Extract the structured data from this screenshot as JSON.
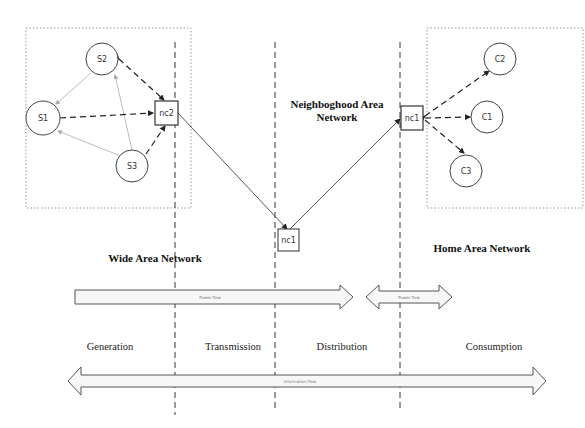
{
  "diagram": {
    "regions": {
      "wan": "Wide Area Network",
      "nan_line1": "Neighboghood  Area",
      "nan_line2": "Network",
      "han": "Home  Area Network"
    },
    "nodes": {
      "s1": "S1",
      "s2": "S2",
      "s3": "S3",
      "nc2": "nc2",
      "nc1_mid": "nc1",
      "nc1_home": "nc1",
      "c1": "C1",
      "c2": "C2",
      "c3": "C3"
    },
    "stages": [
      "Generation",
      "Transmission",
      "Distribution",
      "Consumption"
    ],
    "flows": {
      "power_main": "Power flow",
      "power_home": "Power flow",
      "information": "Information flow"
    },
    "edges": [
      {
        "from": "S1",
        "to": "nc2",
        "style": "dashed"
      },
      {
        "from": "S2",
        "to": "nc2",
        "style": "dashed"
      },
      {
        "from": "S3",
        "to": "nc2",
        "style": "dashed"
      },
      {
        "from": "S2",
        "to": "S1",
        "style": "thin-gray"
      },
      {
        "from": "S3",
        "to": "S1",
        "style": "thin-gray"
      },
      {
        "from": "S3",
        "to": "S2",
        "style": "thin-gray"
      },
      {
        "from": "nc2",
        "to": "nc1",
        "style": "solid"
      },
      {
        "from": "nc1",
        "to": "nc1 (home)",
        "style": "solid"
      },
      {
        "from": "nc1 (home)",
        "to": "C1",
        "style": "dashed"
      },
      {
        "from": "nc1 (home)",
        "to": "C2",
        "style": "dashed"
      },
      {
        "from": "nc1 (home)",
        "to": "C3",
        "style": "dashed"
      }
    ]
  }
}
